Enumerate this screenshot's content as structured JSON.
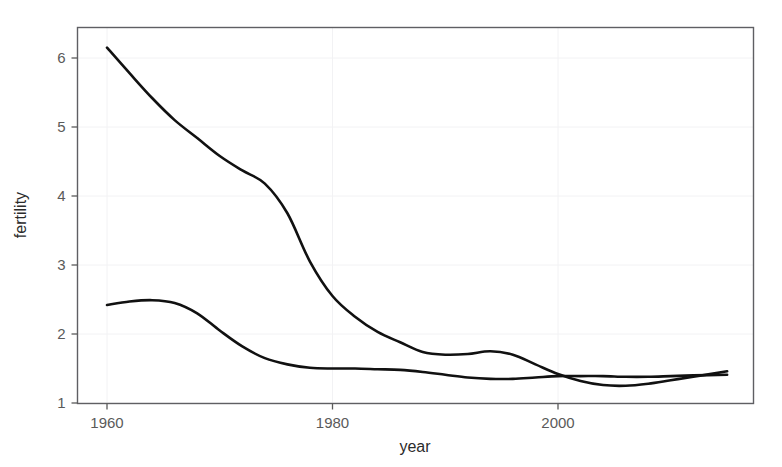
{
  "chart_data": {
    "type": "line",
    "title": "",
    "xlabel": "year",
    "ylabel": "fertility",
    "xlim": [
      1960,
      2015
    ],
    "ylim": [
      1,
      6.45
    ],
    "grid": true,
    "legend": "none",
    "background": "#ffffff",
    "line_color": "#111111",
    "axis_color": "#5f5f63",
    "grid_color": "#f2f2f4",
    "xticks": [
      1960,
      1980,
      2000
    ],
    "xtick_labels": [
      "1960",
      "1980",
      "2000"
    ],
    "yticks": [
      1,
      2,
      3,
      4,
      5,
      6
    ],
    "ytick_labels": [
      "1",
      "2",
      "3",
      "4",
      "5",
      "6"
    ],
    "series": [
      {
        "name": "upper-curve",
        "x": [
          1960,
          1962,
          1964,
          1966,
          1968,
          1970,
          1972,
          1974,
          1976,
          1978,
          1980,
          1982,
          1984,
          1986,
          1988,
          1990,
          1992,
          1994,
          1996,
          1998,
          2000,
          2002,
          2004,
          2006,
          2008,
          2010,
          2012,
          2015
        ],
        "values": [
          6.15,
          5.78,
          5.42,
          5.1,
          4.84,
          4.58,
          4.37,
          4.18,
          3.75,
          3.05,
          2.55,
          2.25,
          2.03,
          1.88,
          1.74,
          1.7,
          1.71,
          1.75,
          1.7,
          1.56,
          1.42,
          1.32,
          1.26,
          1.25,
          1.28,
          1.33,
          1.38,
          1.46
        ]
      },
      {
        "name": "lower-curve",
        "x": [
          1960,
          1962,
          1964,
          1966,
          1968,
          1970,
          1972,
          1974,
          1976,
          1978,
          1980,
          1982,
          1984,
          1986,
          1988,
          1990,
          1992,
          1994,
          1996,
          1998,
          2000,
          2002,
          2004,
          2006,
          2008,
          2010,
          2012,
          2015
        ],
        "values": [
          2.42,
          2.47,
          2.49,
          2.45,
          2.3,
          2.05,
          1.82,
          1.65,
          1.56,
          1.51,
          1.5,
          1.5,
          1.49,
          1.48,
          1.45,
          1.41,
          1.37,
          1.35,
          1.35,
          1.37,
          1.39,
          1.39,
          1.39,
          1.38,
          1.38,
          1.39,
          1.4,
          1.41
        ]
      }
    ]
  }
}
